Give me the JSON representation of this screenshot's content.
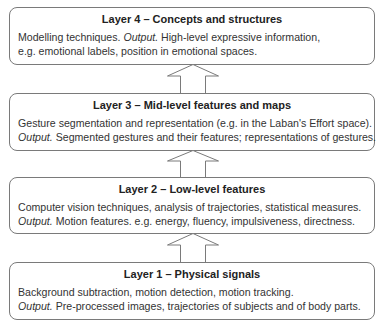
{
  "diagram": {
    "layers": [
      {
        "title": "Layer 4 – Concepts and structures",
        "lines": [
          {
            "pre": "Modelling techniques. ",
            "output_label": "Output.",
            "post": " High-level expressive information,"
          },
          {
            "pre": "e.g. emotional labels, position in emotional spaces.",
            "output_label": "",
            "post": ""
          }
        ]
      },
      {
        "title": "Layer 3 – Mid-level features and maps",
        "lines": [
          {
            "pre": "Gesture segmentation and representation (e.g. in the Laban's Effort space).",
            "output_label": "",
            "post": ""
          },
          {
            "pre": "",
            "output_label": "Output.",
            "post": " Segmented gestures and their features; representations of gestures."
          }
        ]
      },
      {
        "title": "Layer 2 – Low-level features",
        "lines": [
          {
            "pre": "Computer vision techniques, analysis of trajectories, statistical measures.",
            "output_label": "",
            "post": ""
          },
          {
            "pre": "",
            "output_label": "Output.",
            "post": " Motion features. e.g. energy, fluency, impulsiveness, directness."
          }
        ]
      },
      {
        "title": "Layer 1 – Physical signals",
        "lines": [
          {
            "pre": "Background subtraction, motion detection, motion tracking.",
            "output_label": "",
            "post": ""
          },
          {
            "pre": "",
            "output_label": "Output.",
            "post": " Pre-processed images, trajectories of subjects and of body parts."
          }
        ]
      }
    ],
    "arrows": [
      {
        "from": "Layer 3",
        "to": "Layer 4",
        "direction": "up"
      },
      {
        "from": "Layer 2",
        "to": "Layer 3",
        "direction": "up"
      },
      {
        "from": "Layer 1",
        "to": "Layer 2",
        "direction": "up"
      }
    ],
    "colors": {
      "border": "#7a7a7a",
      "text": "#2b2b2b",
      "background": "#ffffff"
    }
  }
}
